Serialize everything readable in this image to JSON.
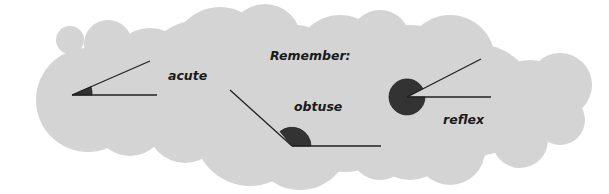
{
  "title": "Remember:",
  "colors": {
    "cloud": "#d4d4d4",
    "angle_fill": "#333333",
    "line": "#222222",
    "text": "#1a1a1a",
    "background": "#ffffff"
  },
  "angles": [
    {
      "name": "acute",
      "label": "acute",
      "type": "acute"
    },
    {
      "name": "obtuse",
      "label": "obtuse",
      "type": "obtuse"
    },
    {
      "name": "reflex",
      "label": "reflex",
      "type": "reflex"
    }
  ]
}
